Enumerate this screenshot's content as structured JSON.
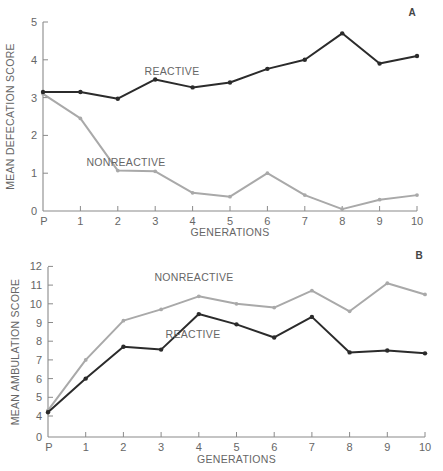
{
  "colors": {
    "reactive": "#2b2b2b",
    "nonreactive": "#a9a9a9",
    "axis": "#8a8a8a"
  },
  "chart_data": [
    {
      "panel": "A",
      "type": "line",
      "title": "",
      "xlabel": "GENERATIONS",
      "ylabel": "MEAN DEFECATION SCORE",
      "categories": [
        "P",
        "1",
        "2",
        "3",
        "4",
        "5",
        "6",
        "7",
        "8",
        "9",
        "10"
      ],
      "yticks": [
        0,
        1,
        2,
        3,
        4,
        5
      ],
      "ylim": [
        0,
        5
      ],
      "grid": false,
      "legend": "inline labels",
      "series": [
        {
          "name": "REACTIVE",
          "values": [
            3.15,
            3.15,
            2.97,
            3.48,
            3.27,
            3.4,
            3.76,
            4.0,
            4.7,
            3.9,
            4.1
          ]
        },
        {
          "name": "NONREACTIVE",
          "values": [
            3.1,
            2.45,
            1.07,
            1.05,
            0.48,
            0.38,
            1.0,
            0.42,
            0.05,
            0.3,
            0.42
          ]
        }
      ]
    },
    {
      "panel": "B",
      "type": "line",
      "title": "",
      "xlabel": "GENERATIONS",
      "ylabel": "MEAN AMBULATION SCORE",
      "categories": [
        "P",
        "1",
        "2",
        "3",
        "4",
        "5",
        "6",
        "7",
        "8",
        "9",
        "10"
      ],
      "yticks": [
        0,
        4,
        5,
        6,
        7,
        8,
        9,
        10,
        11,
        12
      ],
      "ylim": [
        0,
        12
      ],
      "axis_break": "0 to 4",
      "grid": false,
      "legend": "inline labels",
      "series": [
        {
          "name": "NONREACTIVE",
          "values": [
            4.3,
            7.0,
            9.1,
            9.7,
            10.4,
            10.0,
            9.8,
            10.7,
            9.6,
            11.1,
            10.5
          ]
        },
        {
          "name": "REACTIVE",
          "values": [
            4.2,
            6.0,
            7.7,
            7.55,
            9.45,
            8.9,
            8.2,
            9.3,
            7.4,
            7.5,
            7.35
          ]
        }
      ]
    }
  ]
}
